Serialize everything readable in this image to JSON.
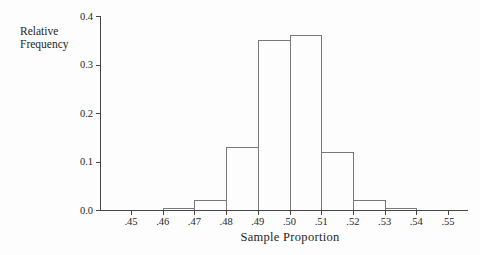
{
  "figure": {
    "background": "#fdfdfd",
    "axis_color": "#454545",
    "bar_outline_color": "#787878",
    "bar_fill_color": "#fdfdfd",
    "text_color": "#1f1f1f"
  },
  "chart_data": {
    "type": "bar",
    "chart_kind": "histogram",
    "title": "",
    "xlabel": "Sample Proportion",
    "ylabel": "Relative Frequency",
    "ylabel_lines": [
      "Relative",
      "Frequency"
    ],
    "xlim": [
      0.44,
      0.556
    ],
    "ylim": [
      0.0,
      0.4
    ],
    "grid": "off",
    "legend": "none",
    "x_tick_values": [
      0.45,
      0.46,
      0.47,
      0.48,
      0.49,
      0.5,
      0.51,
      0.52,
      0.53,
      0.54,
      0.55
    ],
    "x_tick_labels": [
      ".45",
      ".46",
      ".47",
      ".48",
      ".49",
      ".50",
      ".51",
      ".52",
      ".53",
      ".54",
      ".55"
    ],
    "y_tick_values": [
      0.0,
      0.1,
      0.2,
      0.3,
      0.4
    ],
    "y_tick_labels": [
      "0.0",
      "0.1",
      "0.2",
      "0.3",
      "0.4"
    ],
    "bin_width": 0.01,
    "bins": [
      {
        "from": 0.46,
        "to": 0.47,
        "value": 0.005
      },
      {
        "from": 0.47,
        "to": 0.48,
        "value": 0.02
      },
      {
        "from": 0.48,
        "to": 0.49,
        "value": 0.13
      },
      {
        "from": 0.49,
        "to": 0.5,
        "value": 0.35
      },
      {
        "from": 0.5,
        "to": 0.51,
        "value": 0.36
      },
      {
        "from": 0.51,
        "to": 0.52,
        "value": 0.12
      },
      {
        "from": 0.52,
        "to": 0.53,
        "value": 0.02
      },
      {
        "from": 0.53,
        "to": 0.54,
        "value": 0.005
      }
    ]
  }
}
